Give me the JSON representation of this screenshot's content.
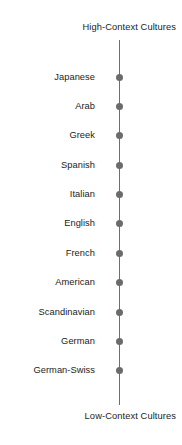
{
  "figure": {
    "width": 182,
    "height": 445,
    "background_color": "#ffffff"
  },
  "axis": {
    "orientation": "vertical",
    "color": "#6e6e6e",
    "top_pole_label": "High-Context Cultures",
    "bottom_pole_label": "Low-Context Cultures"
  },
  "marker": {
    "shape": "circle",
    "color": "#6b6b6b",
    "diameter_px": 7
  },
  "chart_data": {
    "type": "scatter",
    "title": "",
    "subtitle": "",
    "xlabel": "",
    "ylabel": "",
    "orientation": "vertical",
    "grid": false,
    "legend": null,
    "axis_endpoint_labels": {
      "top": "High-Context Cultures",
      "bottom": "Low-Context Cultures"
    },
    "categories": [
      "Japanese",
      "Arab",
      "Greek",
      "Spanish",
      "Italian",
      "English",
      "French",
      "American",
      "Scandinavian",
      "German",
      "German-Swiss"
    ],
    "values": [
      11,
      10,
      9,
      8,
      7,
      6,
      5,
      4,
      3,
      2,
      1
    ],
    "ylim": [
      0,
      12
    ],
    "y_positions_px": [
      77,
      106,
      135,
      165,
      194,
      223,
      253,
      282,
      312,
      341,
      370
    ],
    "series": [
      {
        "name": "Context ranking",
        "values": [
          11,
          10,
          9,
          8,
          7,
          6,
          5,
          4,
          3,
          2,
          1
        ]
      }
    ],
    "annotations": [
      "High-Context Cultures",
      "Low-Context Cultures"
    ]
  }
}
